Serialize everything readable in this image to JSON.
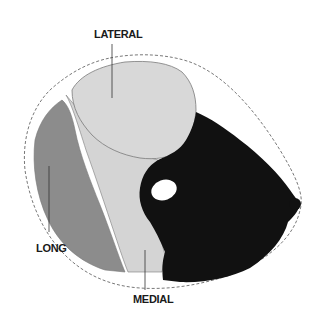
{
  "labels": {
    "lateral": "LATERAL",
    "long": "LONG",
    "medial": "MEDIAL"
  },
  "regions": [
    {
      "name": "lateral-head",
      "color": "#d8d8d8"
    },
    {
      "name": "long-head",
      "color": "#8c8c8c"
    },
    {
      "name": "medial-head",
      "color": "#d4d4d4"
    },
    {
      "name": "anterior-compartment",
      "color": "#111111"
    },
    {
      "name": "bone",
      "color": "#ffffff"
    }
  ],
  "colors": {
    "background": "#ffffff",
    "outline": "#555555",
    "label": "#1a1a1a"
  }
}
